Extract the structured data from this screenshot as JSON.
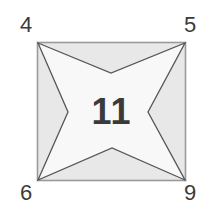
{
  "figure": {
    "type": "four-pointed-star-in-square",
    "center_value": "11",
    "corner_labels": {
      "top_left": "4",
      "top_right": "5",
      "bottom_left": "6",
      "bottom_right": "9"
    },
    "colors": {
      "page_background": "#ffffff",
      "square_fill": "#e8e8e8",
      "square_stroke": "#9a9a9a",
      "star_fill": "#f8f8f8",
      "star_stroke": "#55555a",
      "label_text": "#3b3b3b",
      "center_text": "#3a3a3a"
    },
    "geometry": {
      "square": {
        "x": 37,
        "y": 42,
        "width": 149,
        "height": 139
      },
      "star_points": [
        {
          "name": "tip-top-left",
          "x": 37,
          "y": 42
        },
        {
          "name": "notch-top",
          "x": 111,
          "y": 73
        },
        {
          "name": "tip-top-right",
          "x": 186,
          "y": 42
        },
        {
          "name": "notch-right",
          "x": 148,
          "y": 112
        },
        {
          "name": "tip-bottom-right",
          "x": 186,
          "y": 181
        },
        {
          "name": "notch-bottom",
          "x": 112,
          "y": 148
        },
        {
          "name": "tip-bottom-left",
          "x": 37,
          "y": 181
        },
        {
          "name": "notch-left",
          "x": 68,
          "y": 112
        }
      ]
    }
  }
}
